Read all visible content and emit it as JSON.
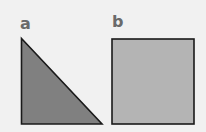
{
  "panels": [
    {
      "label": "a",
      "shape": "right-triangle",
      "fill": "#808080",
      "stroke": "#1a1a1a"
    },
    {
      "label": "b",
      "shape": "square",
      "fill": "#b4b4b4",
      "stroke": "#1a1a1a"
    }
  ],
  "background": "#f1f1f1"
}
